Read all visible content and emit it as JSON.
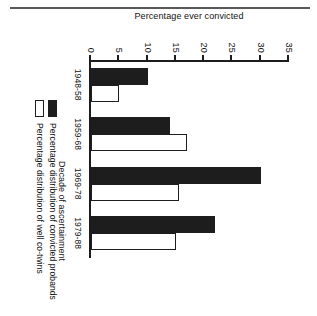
{
  "chart_data": {
    "type": "bar",
    "title": "",
    "xlabel": "Decade of ascertainment",
    "ylabel": "Percentage ever convicted",
    "categories": [
      "1948-58",
      "1959-68",
      "1969-78",
      "1979-88"
    ],
    "series": [
      {
        "name": "Percentage distribution of convicted probands",
        "color": "#1d1d1d",
        "style": "filled",
        "values": [
          10,
          14,
          30,
          22
        ]
      },
      {
        "name": "Percentage distribution of well co-twins",
        "color": "#ffffff",
        "style": "hollow",
        "values": [
          5,
          17,
          15.5,
          15
        ]
      }
    ],
    "ylim": [
      0,
      35
    ],
    "yticks": [
      0,
      5,
      10,
      15,
      20,
      25,
      30,
      35
    ],
    "ytick_labels": [
      "0",
      "5",
      "10",
      "15",
      "20",
      "25",
      "30",
      "35"
    ],
    "grid": false,
    "legend_position": "bottom-left",
    "orientation": "rotated-90"
  },
  "figure": {
    "rule_label": "page-rule"
  }
}
